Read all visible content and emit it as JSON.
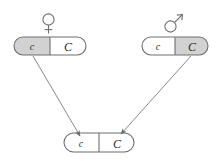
{
  "diagram": {
    "type": "genetics-cross",
    "colors": {
      "stroke": "#6f6f6f",
      "shaded_fill": "#d2d2d2",
      "plain_fill": "#ffffff",
      "text": "#2b2b2b",
      "arrow": "#8a8a8a",
      "background": "#ffffff"
    },
    "symbols": {
      "female": {
        "name": "female-venus-symbol",
        "glyph": "♀"
      },
      "male": {
        "name": "male-mars-symbol",
        "glyph": "♂"
      }
    },
    "parents": [
      {
        "id": "mother",
        "role": "female-parent",
        "symbol_glyph": "♀",
        "alleles": [
          {
            "label": "c",
            "case": "lower",
            "shaded": true
          },
          {
            "label": "C",
            "case": "upper",
            "shaded": false
          }
        ],
        "contributed_allele": "c"
      },
      {
        "id": "father",
        "role": "male-parent",
        "symbol_glyph": "♂",
        "alleles": [
          {
            "label": "c",
            "case": "lower",
            "shaded": false
          },
          {
            "label": "C",
            "case": "upper",
            "shaded": true
          }
        ],
        "contributed_allele": "C"
      }
    ],
    "offspring": {
      "id": "offspring",
      "role": "offspring",
      "alleles": [
        {
          "label": "c",
          "case": "lower",
          "shaded": false
        },
        {
          "label": "C",
          "case": "upper",
          "shaded": false
        }
      ]
    },
    "arrows": [
      {
        "name": "arrow-mother-to-offspring",
        "from": "mother",
        "to": "offspring"
      },
      {
        "name": "arrow-father-to-offspring",
        "from": "father",
        "to": "offspring"
      }
    ]
  }
}
